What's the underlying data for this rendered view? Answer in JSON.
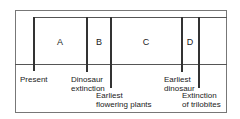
{
  "diagram": {
    "regions": [
      {
        "label": "A",
        "x": 60
      },
      {
        "label": "B",
        "x": 99
      },
      {
        "label": "C",
        "x": 146
      },
      {
        "label": "D",
        "x": 190
      }
    ],
    "markers": [
      {
        "id": "present",
        "line1": "Present",
        "line2": "",
        "x": 34,
        "bottom": 71
      },
      {
        "id": "dinosaur-extinction",
        "line1": "Dinosaur",
        "line2": "extinction",
        "x": 87,
        "bottom": 72
      },
      {
        "id": "earliest-flowering-plants",
        "line1": "Earliest",
        "line2": "flowering plants",
        "x": 111,
        "bottom": 88
      },
      {
        "id": "earliest-dinosaur",
        "line1": "Earliest",
        "line2": "dinosaur",
        "x": 182,
        "bottom": 72
      },
      {
        "id": "extinction-of-trilobites",
        "line1": "Extinction",
        "line2": "of trilobites",
        "x": 199,
        "bottom": 88
      }
    ]
  }
}
